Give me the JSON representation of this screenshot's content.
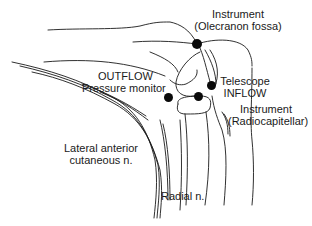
{
  "diagram": {
    "labels": {
      "instrument_olecranon_line1": "Instrument",
      "instrument_olecranon_line2": "(Olecranon  fossa)",
      "outflow_line1": "OUTFLOW",
      "outflow_line2": "Pressure  monitor",
      "telescope_line1": "Telescope",
      "telescope_line2": "INFLOW",
      "instrument_radiocap_line1": "Instrument",
      "instrument_radiocap_line2": "(Radiocapitellar)",
      "lateral_line1": "Lateral  anterior",
      "lateral_line2": "cutaneous  n.",
      "radial": "Radial  n."
    },
    "portals": [
      {
        "name": "olecranon-fossa",
        "x": 197,
        "y": 44
      },
      {
        "name": "telescope-inflow",
        "x": 211,
        "y": 85
      },
      {
        "name": "radiocapitellar",
        "x": 198,
        "y": 96
      },
      {
        "name": "outflow",
        "x": 169,
        "y": 98
      }
    ],
    "colors": {
      "line": "#1a1a1a",
      "portal": "#0a0a0a",
      "background": "#ffffff"
    }
  }
}
